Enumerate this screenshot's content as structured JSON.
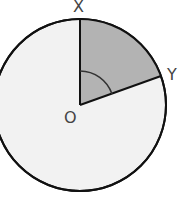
{
  "diagram": {
    "type": "circle-sector",
    "center_label": "O",
    "point_labels": [
      "X",
      "Y"
    ],
    "shaded_sector": "XOY",
    "colors": {
      "circle_fill": "#f2f2f2",
      "sector_fill": "#b3b3b3",
      "stroke": "#111111",
      "label": "#444444"
    }
  }
}
